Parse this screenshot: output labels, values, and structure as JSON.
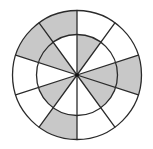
{
  "diagram": {
    "title": "Shaded circle divided into two concentric rings and 10 equal sectors",
    "canvas": {
      "width": 153,
      "height": 149,
      "background": "#ffffff"
    },
    "center": {
      "x": 77,
      "y": 75
    },
    "inner_radius": 40.5,
    "outer_radius": 64.5,
    "sector_count": 10,
    "start_angle_deg": -90,
    "sector_span_deg": 36,
    "colors": {
      "shaded": "#c8c8c8",
      "unshaded": "#ffffff",
      "stroke": "#2a2a2a",
      "center_dot": "#111111"
    },
    "stroke_width": 1.3,
    "center_dot_radius": 1.8,
    "sectors": [
      {
        "index": 0,
        "from_deg": -90,
        "to_deg": -54,
        "inner_shaded": true,
        "outer_shaded": false
      },
      {
        "index": 1,
        "from_deg": -54,
        "to_deg": -18,
        "inner_shaded": false,
        "outer_shaded": false
      },
      {
        "index": 2,
        "from_deg": -18,
        "to_deg": 18,
        "inner_shaded": true,
        "outer_shaded": true
      },
      {
        "index": 3,
        "from_deg": 18,
        "to_deg": 54,
        "inner_shaded": true,
        "outer_shaded": false
      },
      {
        "index": 4,
        "from_deg": 54,
        "to_deg": 90,
        "inner_shaded": false,
        "outer_shaded": false
      },
      {
        "index": 5,
        "from_deg": 90,
        "to_deg": 126,
        "inner_shaded": false,
        "outer_shaded": true
      },
      {
        "index": 6,
        "from_deg": 126,
        "to_deg": 162,
        "inner_shaded": true,
        "outer_shaded": false
      },
      {
        "index": 7,
        "from_deg": 162,
        "to_deg": 198,
        "inner_shaded": false,
        "outer_shaded": false
      },
      {
        "index": 8,
        "from_deg": 198,
        "to_deg": 234,
        "inner_shaded": true,
        "outer_shaded": true
      },
      {
        "index": 9,
        "from_deg": 234,
        "to_deg": 270,
        "inner_shaded": false,
        "outer_shaded": true
      }
    ],
    "summary": {
      "total_regions": 20,
      "shaded_inner": 5,
      "shaded_outer": 4,
      "shaded_total": 9
    }
  }
}
